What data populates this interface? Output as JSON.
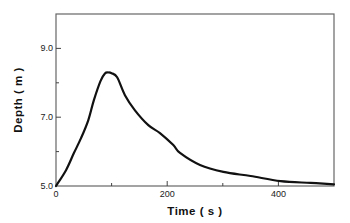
{
  "chart_data": {
    "type": "line",
    "title": "",
    "xlabel": "Time ( s )",
    "ylabel": "Depth ( m )",
    "xlim": [
      0,
      500
    ],
    "ylim": [
      5.0,
      10.0
    ],
    "x_ticks": [
      0,
      100,
      200,
      300,
      400,
      500
    ],
    "x_tick_labels": [
      "0",
      "",
      "200",
      "",
      "400",
      ""
    ],
    "y_ticks": [
      5.0,
      6.0,
      7.0,
      8.0,
      9.0,
      10.0
    ],
    "y_tick_labels": [
      "5.0",
      "",
      "7.0",
      "",
      "9.0",
      ""
    ],
    "grid": false,
    "legend": null,
    "series": [
      {
        "name": "Depth",
        "color": "#111111",
        "x": [
          0,
          18,
          32,
          45,
          58,
          68,
          80,
          88,
          94,
          100,
          110,
          124,
          142,
          166,
          187,
          211,
          223,
          259,
          301,
          350,
          404,
          458,
          500
        ],
        "y": [
          5.0,
          5.46,
          5.95,
          6.39,
          6.91,
          7.49,
          8.05,
          8.27,
          8.3,
          8.28,
          8.16,
          7.64,
          7.2,
          6.77,
          6.54,
          6.19,
          5.96,
          5.61,
          5.41,
          5.29,
          5.14,
          5.09,
          5.05
        ]
      }
    ]
  }
}
